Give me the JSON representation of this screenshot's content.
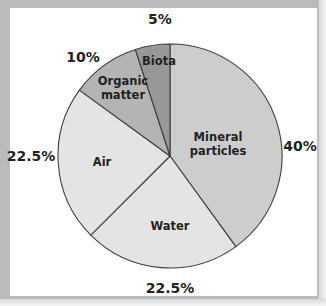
{
  "figure": {
    "width": 326,
    "height": 306,
    "background_color": "#ffffff",
    "frame_color": "#b9bbbd",
    "outline_color": "#3f3f3f"
  },
  "chart_data": {
    "type": "pie",
    "title": "",
    "subtitle": "",
    "xlabel": "",
    "ylabel": "",
    "grid": false,
    "legend_position": "none",
    "labels_inside_slices": true,
    "unit": "%",
    "total": 100,
    "start_angle_deg": 0,
    "direction": "clockwise",
    "center": {
      "x": 170,
      "y": 156
    },
    "radius": 112,
    "categories": [
      "Mineral particles",
      "Water",
      "Air",
      "Organic matter",
      "Biota"
    ],
    "values": [
      40,
      22.5,
      22.5,
      10,
      5
    ],
    "value_labels": [
      "40%",
      "22.5%",
      "22.5%",
      "10%",
      "5%"
    ],
    "colors": [
      "#cdcdcd",
      "#e4e4e4",
      "#e4e4e4",
      "#b4b4b4",
      "#989898"
    ],
    "slices": [
      {
        "name": "Mineral particles",
        "label": "Mineral\nparticles",
        "value": 40,
        "value_label": "40%",
        "color": "#cdcdcd",
        "start_angle_deg": 0,
        "end_angle_deg": 144,
        "label_x": 218,
        "label_y": 145,
        "pct_x": 300,
        "pct_y": 146
      },
      {
        "name": "Water",
        "label": "Water",
        "value": 22.5,
        "value_label": "22.5%",
        "color": "#e4e4e4",
        "start_angle_deg": 144,
        "end_angle_deg": 225,
        "label_x": 170,
        "label_y": 227,
        "pct_x": 170,
        "pct_y": 288
      },
      {
        "name": "Air",
        "label": "Air",
        "value": 22.5,
        "value_label": "22.5%",
        "color": "#e4e4e4",
        "start_angle_deg": 225,
        "end_angle_deg": 306,
        "label_x": 102,
        "label_y": 163,
        "pct_x": 31,
        "pct_y": 156
      },
      {
        "name": "Organic matter",
        "label": "Organic\nmatter",
        "value": 10,
        "value_label": "10%",
        "color": "#b4b4b4",
        "start_angle_deg": 306,
        "end_angle_deg": 342,
        "label_x": 123,
        "label_y": 89,
        "pct_x": 83,
        "pct_y": 57
      },
      {
        "name": "Biota",
        "label": "Biota",
        "value": 5,
        "value_label": "5%",
        "color": "#989898",
        "start_angle_deg": 342,
        "end_angle_deg": 360,
        "label_x": 159,
        "label_y": 62,
        "pct_x": 160,
        "pct_y": 19
      }
    ]
  }
}
